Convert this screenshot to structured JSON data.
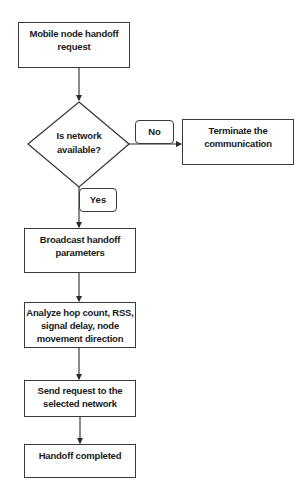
{
  "flowchart": {
    "nodes": {
      "start": {
        "type": "process",
        "lines": [
          "Mobile node handoff",
          "request"
        ]
      },
      "decision": {
        "type": "decision",
        "lines": [
          "Is network",
          "available?"
        ]
      },
      "terminate": {
        "type": "process",
        "lines": [
          "Terminate the",
          "communication"
        ]
      },
      "broadcast": {
        "type": "process",
        "lines": [
          "Broadcast handoff",
          "parameters"
        ]
      },
      "analyze": {
        "type": "process",
        "lines": [
          "Analyze hop count, RSS,",
          "signal delay, node",
          "movement direction"
        ]
      },
      "send": {
        "type": "process",
        "lines": [
          "Send request to the",
          "selected network"
        ]
      },
      "completed": {
        "type": "process",
        "lines": [
          "Handoff completed"
        ]
      }
    },
    "edge_labels": {
      "no": "No",
      "yes": "Yes"
    },
    "edges": [
      {
        "from": "start",
        "to": "decision"
      },
      {
        "from": "decision",
        "to": "terminate",
        "label": "No"
      },
      {
        "from": "decision",
        "to": "broadcast",
        "label": "Yes"
      },
      {
        "from": "broadcast",
        "to": "analyze"
      },
      {
        "from": "analyze",
        "to": "send"
      },
      {
        "from": "send",
        "to": "completed"
      }
    ],
    "colors": {
      "stroke": "#3a3a3a",
      "text": "#1a1a1a",
      "background": "#ffffff"
    }
  }
}
